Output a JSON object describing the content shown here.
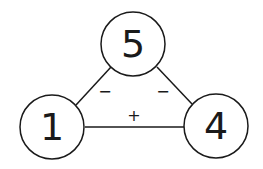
{
  "diagram": {
    "type": "number-triangle",
    "nodes": [
      {
        "id": "top",
        "label": "5",
        "cx": 133,
        "cy": 44,
        "r": 32
      },
      {
        "id": "left",
        "label": "1",
        "cx": 52,
        "cy": 127,
        "r": 32
      },
      {
        "id": "right",
        "label": "4",
        "cx": 216,
        "cy": 126,
        "r": 32
      }
    ],
    "edges": [
      {
        "from": "top",
        "to": "left",
        "sign": "−"
      },
      {
        "from": "top",
        "to": "right",
        "sign": "−"
      },
      {
        "from": "left",
        "to": "right",
        "sign": "+"
      }
    ],
    "colors": {
      "stroke": "#1a1a1a",
      "background": "#ffffff"
    }
  }
}
